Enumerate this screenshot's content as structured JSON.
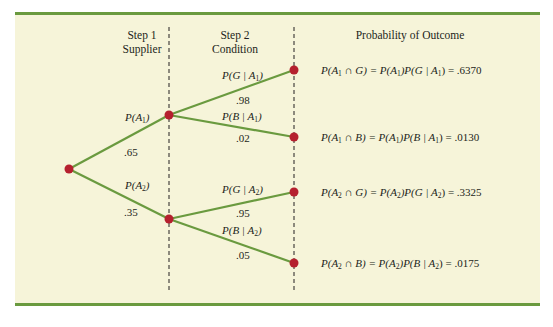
{
  "headers": {
    "step1": [
      "Step 1",
      "Supplier"
    ],
    "step2": [
      "Step 2",
      "Condition"
    ],
    "outcome": "Probability of Outcome"
  },
  "branches": {
    "a1": {
      "label_main": "P(A",
      "label_sub": "1",
      "label_end": ")",
      "value": ".65"
    },
    "a2": {
      "label_main": "P(A",
      "label_sub": "2",
      "label_end": ")",
      "value": ".35"
    },
    "g_a1": {
      "label_main": "P(G | A",
      "label_sub": "1",
      "label_end": ")",
      "value": ".98"
    },
    "b_a1": {
      "label_main": "P(B | A",
      "label_sub": "1",
      "label_end": ")",
      "value": ".02"
    },
    "g_a2": {
      "label_main": "P(G | A",
      "label_sub": "2",
      "label_end": ")",
      "value": ".95"
    },
    "b_a2": {
      "label_main": "P(B | A",
      "label_sub": "2",
      "label_end": ")",
      "value": ".05"
    }
  },
  "outcomes": [
    {
      "lhs": "P(A",
      "sub1": "1",
      "mid1": " ∩ G) = P(A",
      "sub2": "1",
      "mid2": ")P(G | A",
      "sub3": "1",
      "rhs": ") = .6370"
    },
    {
      "lhs": "P(A",
      "sub1": "1",
      "mid1": " ∩ B) = P(A",
      "sub2": "1",
      "mid2": ")P(B | A",
      "sub3": "1",
      "rhs": ") = .0130"
    },
    {
      "lhs": "P(A",
      "sub1": "2",
      "mid1": " ∩ G) = P(A",
      "sub2": "2",
      "mid2": ")P(G | A",
      "sub3": "2",
      "rhs": ") = .3325"
    },
    {
      "lhs": "P(A",
      "sub1": "2",
      "mid1": " ∩ B) = P(A",
      "sub2": "2",
      "mid2": ")P(B | A",
      "sub3": "2",
      "rhs": ") = .0175"
    }
  ],
  "colors": {
    "panel_bg": "#f6f4d9",
    "rule": "#6a9a3f",
    "branch": "#6a9a3f",
    "node": "#b5202e",
    "dash": "#231f20"
  }
}
